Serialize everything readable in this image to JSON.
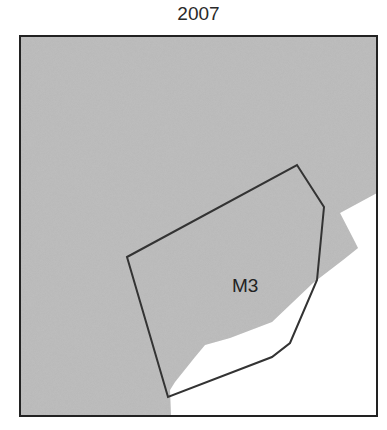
{
  "title": "2007",
  "map": {
    "frame": {
      "x": 20,
      "y": 36,
      "width": 357,
      "height": 380
    },
    "colors": {
      "land": "#b7b7b7",
      "water": "#ffffff",
      "outline": "#333333",
      "frame": "#222222"
    },
    "zone": {
      "label": "M3",
      "label_pos": {
        "x": 232,
        "y": 292
      },
      "polygon": [
        [
          127,
          257
        ],
        [
          297,
          165
        ],
        [
          324,
          207
        ],
        [
          317,
          280
        ],
        [
          290,
          343
        ],
        [
          272,
          357
        ],
        [
          168,
          397
        ]
      ]
    },
    "coastline": [
      [
        377,
        193
      ],
      [
        340,
        213
      ],
      [
        355,
        242
      ],
      [
        358,
        248
      ],
      [
        343,
        260
      ],
      [
        313,
        283
      ],
      [
        272,
        322
      ],
      [
        230,
        338
      ],
      [
        205,
        345
      ],
      [
        195,
        357
      ],
      [
        175,
        382
      ],
      [
        170,
        390
      ],
      [
        171,
        416
      ]
    ]
  }
}
